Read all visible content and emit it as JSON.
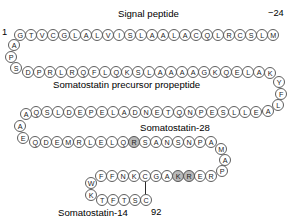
{
  "figure": {
    "title_signal": "Signal peptide",
    "title_propeptide": "Somatostatin precursor propeptide",
    "title_sst28": "Somatostatin-28",
    "title_sst14": "Somatostatin-14",
    "number_start": "1",
    "number_minus24": "−24",
    "number_92": "92",
    "colors": {
      "residue_fill": "#ffffff",
      "residue_stroke": "#5e5e5e",
      "residue_highlight_fill": "#b9b9b9",
      "text": "#000000",
      "background": "#ffffff",
      "bond": "#2a2a2a"
    }
  },
  "residues": [
    {
      "id": "r1",
      "letter": "G",
      "x": 14,
      "y": 29,
      "hl": false
    },
    {
      "id": "r2",
      "letter": "T",
      "x": 25,
      "y": 29,
      "hl": false
    },
    {
      "id": "r3",
      "letter": "V",
      "x": 36,
      "y": 29,
      "hl": false
    },
    {
      "id": "r4",
      "letter": "C",
      "x": 47,
      "y": 29,
      "hl": false
    },
    {
      "id": "r5",
      "letter": "G",
      "x": 58,
      "y": 29,
      "hl": false
    },
    {
      "id": "r6",
      "letter": "L",
      "x": 69,
      "y": 29,
      "hl": false
    },
    {
      "id": "r7",
      "letter": "A",
      "x": 80,
      "y": 29,
      "hl": false
    },
    {
      "id": "r8",
      "letter": "L",
      "x": 91,
      "y": 29,
      "hl": false
    },
    {
      "id": "r9",
      "letter": "V",
      "x": 102,
      "y": 29,
      "hl": false
    },
    {
      "id": "r10",
      "letter": "I",
      "x": 113,
      "y": 29,
      "hl": false
    },
    {
      "id": "r11",
      "letter": "S",
      "x": 124,
      "y": 29,
      "hl": false
    },
    {
      "id": "r12",
      "letter": "L",
      "x": 135,
      "y": 29,
      "hl": false
    },
    {
      "id": "r13",
      "letter": "A",
      "x": 146,
      "y": 29,
      "hl": false
    },
    {
      "id": "r14",
      "letter": "A",
      "x": 157,
      "y": 29,
      "hl": false
    },
    {
      "id": "r15",
      "letter": "L",
      "x": 168,
      "y": 29,
      "hl": false
    },
    {
      "id": "r16",
      "letter": "A",
      "x": 179,
      "y": 29,
      "hl": false
    },
    {
      "id": "r17",
      "letter": "C",
      "x": 190,
      "y": 29,
      "hl": false
    },
    {
      "id": "r18",
      "letter": "Q",
      "x": 201,
      "y": 29,
      "hl": false
    },
    {
      "id": "r19",
      "letter": "L",
      "x": 212,
      "y": 29,
      "hl": false
    },
    {
      "id": "r20",
      "letter": "R",
      "x": 223,
      "y": 29,
      "hl": false
    },
    {
      "id": "r21",
      "letter": "C",
      "x": 234,
      "y": 29,
      "hl": false
    },
    {
      "id": "r22",
      "letter": "S",
      "x": 245,
      "y": 29,
      "hl": false
    },
    {
      "id": "r23",
      "letter": "L",
      "x": 256,
      "y": 29,
      "hl": false
    },
    {
      "id": "r24",
      "letter": "M",
      "x": 267,
      "y": 29,
      "hl": false
    },
    {
      "id": "r25",
      "letter": "A",
      "x": 8,
      "y": 39,
      "hl": false
    },
    {
      "id": "r26",
      "letter": "P",
      "x": 5,
      "y": 51,
      "hl": false
    },
    {
      "id": "r27",
      "letter": "S",
      "x": 10,
      "y": 62,
      "hl": false
    },
    {
      "id": "r28",
      "letter": "D",
      "x": 22,
      "y": 66,
      "hl": false
    },
    {
      "id": "r29",
      "letter": "P",
      "x": 33,
      "y": 66,
      "hl": false
    },
    {
      "id": "r30",
      "letter": "R",
      "x": 44,
      "y": 66,
      "hl": false
    },
    {
      "id": "r31",
      "letter": "L",
      "x": 55,
      "y": 66,
      "hl": false
    },
    {
      "id": "r32",
      "letter": "R",
      "x": 66,
      "y": 66,
      "hl": false
    },
    {
      "id": "r33",
      "letter": "Q",
      "x": 77,
      "y": 66,
      "hl": false
    },
    {
      "id": "r34",
      "letter": "F",
      "x": 88,
      "y": 66,
      "hl": false
    },
    {
      "id": "r35",
      "letter": "L",
      "x": 99,
      "y": 66,
      "hl": false
    },
    {
      "id": "r36",
      "letter": "Q",
      "x": 110,
      "y": 66,
      "hl": false
    },
    {
      "id": "r37",
      "letter": "K",
      "x": 121,
      "y": 66,
      "hl": false
    },
    {
      "id": "r38",
      "letter": "S",
      "x": 132,
      "y": 66,
      "hl": false
    },
    {
      "id": "r39",
      "letter": "L",
      "x": 143,
      "y": 66,
      "hl": false
    },
    {
      "id": "r40",
      "letter": "A",
      "x": 154,
      "y": 66,
      "hl": false
    },
    {
      "id": "r41",
      "letter": "A",
      "x": 165,
      "y": 66,
      "hl": false
    },
    {
      "id": "r42",
      "letter": "A",
      "x": 176,
      "y": 66,
      "hl": false
    },
    {
      "id": "r43",
      "letter": "A",
      "x": 187,
      "y": 66,
      "hl": false
    },
    {
      "id": "r44",
      "letter": "G",
      "x": 198,
      "y": 66,
      "hl": false
    },
    {
      "id": "r45",
      "letter": "K",
      "x": 209,
      "y": 66,
      "hl": false
    },
    {
      "id": "r46",
      "letter": "Q",
      "x": 220,
      "y": 66,
      "hl": false
    },
    {
      "id": "r47",
      "letter": "E",
      "x": 231,
      "y": 66,
      "hl": false
    },
    {
      "id": "r48",
      "letter": "L",
      "x": 242,
      "y": 66,
      "hl": false
    },
    {
      "id": "r49",
      "letter": "A",
      "x": 253,
      "y": 66,
      "hl": false
    },
    {
      "id": "r50",
      "letter": "K",
      "x": 264,
      "y": 67,
      "hl": false
    },
    {
      "id": "r51",
      "letter": "Y",
      "x": 273,
      "y": 76,
      "hl": false
    },
    {
      "id": "r52",
      "letter": "F",
      "x": 275,
      "y": 88,
      "hl": false
    },
    {
      "id": "r53",
      "letter": "L",
      "x": 272,
      "y": 99,
      "hl": false
    },
    {
      "id": "r54",
      "letter": "A",
      "x": 262,
      "y": 105,
      "hl": false
    },
    {
      "id": "r55",
      "letter": "E",
      "x": 250,
      "y": 106,
      "hl": false
    },
    {
      "id": "r56",
      "letter": "L",
      "x": 239,
      "y": 106,
      "hl": false
    },
    {
      "id": "r57",
      "letter": "L",
      "x": 228,
      "y": 106,
      "hl": false
    },
    {
      "id": "r58",
      "letter": "S",
      "x": 217,
      "y": 106,
      "hl": false
    },
    {
      "id": "r59",
      "letter": "E",
      "x": 206,
      "y": 106,
      "hl": false
    },
    {
      "id": "r60",
      "letter": "P",
      "x": 195,
      "y": 106,
      "hl": false
    },
    {
      "id": "r61",
      "letter": "N",
      "x": 184,
      "y": 106,
      "hl": false
    },
    {
      "id": "r62",
      "letter": "Q",
      "x": 173,
      "y": 106,
      "hl": false
    },
    {
      "id": "r63",
      "letter": "T",
      "x": 162,
      "y": 106,
      "hl": false
    },
    {
      "id": "r64",
      "letter": "E",
      "x": 151,
      "y": 106,
      "hl": false
    },
    {
      "id": "r65",
      "letter": "N",
      "x": 140,
      "y": 106,
      "hl": false
    },
    {
      "id": "r66",
      "letter": "D",
      "x": 129,
      "y": 106,
      "hl": false
    },
    {
      "id": "r67",
      "letter": "A",
      "x": 118,
      "y": 106,
      "hl": false
    },
    {
      "id": "r68",
      "letter": "L",
      "x": 107,
      "y": 106,
      "hl": false
    },
    {
      "id": "r69",
      "letter": "E",
      "x": 96,
      "y": 106,
      "hl": false
    },
    {
      "id": "r70",
      "letter": "P",
      "x": 85,
      "y": 106,
      "hl": false
    },
    {
      "id": "r71",
      "letter": "E",
      "x": 74,
      "y": 106,
      "hl": false
    },
    {
      "id": "r72",
      "letter": "D",
      "x": 63,
      "y": 106,
      "hl": false
    },
    {
      "id": "r73",
      "letter": "L",
      "x": 52,
      "y": 106,
      "hl": false
    },
    {
      "id": "r74",
      "letter": "S",
      "x": 41,
      "y": 106,
      "hl": false
    },
    {
      "id": "r75",
      "letter": "Q",
      "x": 30,
      "y": 106,
      "hl": false
    },
    {
      "id": "r76",
      "letter": "A",
      "x": 20,
      "y": 108,
      "hl": false
    },
    {
      "id": "r77",
      "letter": "A",
      "x": 14,
      "y": 120,
      "hl": false
    },
    {
      "id": "r78",
      "letter": "E",
      "x": 17,
      "y": 132,
      "hl": false
    },
    {
      "id": "r79",
      "letter": "Q",
      "x": 29,
      "y": 136,
      "hl": false
    },
    {
      "id": "r80",
      "letter": "D",
      "x": 40,
      "y": 136,
      "hl": false
    },
    {
      "id": "r81",
      "letter": "E",
      "x": 51,
      "y": 136,
      "hl": false
    },
    {
      "id": "r82",
      "letter": "M",
      "x": 62,
      "y": 136,
      "hl": false
    },
    {
      "id": "r83",
      "letter": "R",
      "x": 73,
      "y": 136,
      "hl": false
    },
    {
      "id": "r84",
      "letter": "L",
      "x": 84,
      "y": 136,
      "hl": false
    },
    {
      "id": "r85",
      "letter": "E",
      "x": 95,
      "y": 136,
      "hl": false
    },
    {
      "id": "r86",
      "letter": "L",
      "x": 106,
      "y": 136,
      "hl": false
    },
    {
      "id": "r87",
      "letter": "Q",
      "x": 117,
      "y": 136,
      "hl": false
    },
    {
      "id": "r88",
      "letter": "R",
      "x": 128,
      "y": 136,
      "hl": true
    },
    {
      "id": "r89",
      "letter": "S",
      "x": 139,
      "y": 136,
      "hl": false
    },
    {
      "id": "r90",
      "letter": "A",
      "x": 150,
      "y": 136,
      "hl": false
    },
    {
      "id": "r91",
      "letter": "N",
      "x": 161,
      "y": 136,
      "hl": false
    },
    {
      "id": "r92",
      "letter": "S",
      "x": 172,
      "y": 136,
      "hl": false
    },
    {
      "id": "r93",
      "letter": "N",
      "x": 183,
      "y": 136,
      "hl": false
    },
    {
      "id": "r94",
      "letter": "P",
      "x": 194,
      "y": 136,
      "hl": false
    },
    {
      "id": "r95",
      "letter": "A",
      "x": 205,
      "y": 136,
      "hl": false
    },
    {
      "id": "r96",
      "letter": "M",
      "x": 215,
      "y": 143,
      "hl": false
    },
    {
      "id": "r97",
      "letter": "A",
      "x": 219,
      "y": 154,
      "hl": false
    },
    {
      "id": "r98",
      "letter": "P",
      "x": 216,
      "y": 165,
      "hl": false
    },
    {
      "id": "r99",
      "letter": "R",
      "x": 205,
      "y": 170,
      "hl": false
    },
    {
      "id": "r100",
      "letter": "E",
      "x": 194,
      "y": 170,
      "hl": false
    },
    {
      "id": "r101",
      "letter": "R",
      "x": 183,
      "y": 170,
      "hl": true
    },
    {
      "id": "r102",
      "letter": "K",
      "x": 172,
      "y": 170,
      "hl": true
    },
    {
      "id": "r103",
      "letter": "A",
      "x": 161,
      "y": 170,
      "hl": false
    },
    {
      "id": "r104",
      "letter": "G",
      "x": 150,
      "y": 170,
      "hl": false
    },
    {
      "id": "r105",
      "letter": "C",
      "x": 139,
      "y": 170,
      "hl": false
    },
    {
      "id": "r106",
      "letter": "K",
      "x": 128,
      "y": 170,
      "hl": false
    },
    {
      "id": "r107",
      "letter": "N",
      "x": 117,
      "y": 170,
      "hl": false
    },
    {
      "id": "r108",
      "letter": "F",
      "x": 106,
      "y": 170,
      "hl": false
    },
    {
      "id": "r109",
      "letter": "F",
      "x": 95,
      "y": 170,
      "hl": false
    },
    {
      "id": "r110",
      "letter": "W",
      "x": 85,
      "y": 177,
      "hl": false
    },
    {
      "id": "r111",
      "letter": "K",
      "x": 85,
      "y": 189,
      "hl": false
    },
    {
      "id": "r112",
      "letter": "T",
      "x": 96,
      "y": 194,
      "hl": false
    },
    {
      "id": "r113",
      "letter": "F",
      "x": 107,
      "y": 194,
      "hl": false
    },
    {
      "id": "r114",
      "letter": "T",
      "x": 118,
      "y": 194,
      "hl": false
    },
    {
      "id": "r115",
      "letter": "S",
      "x": 129,
      "y": 194,
      "hl": false
    },
    {
      "id": "r116",
      "letter": "C",
      "x": 140,
      "y": 194,
      "hl": false
    }
  ]
}
